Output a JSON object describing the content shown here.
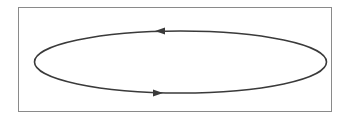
{
  "diagram": {
    "type": "closed-loop",
    "colors": {
      "frame": "#8a8a8a",
      "loop": "#3a3a3a",
      "background": "#ffffff"
    },
    "arrows": [
      {
        "position": "top",
        "direction": "left"
      },
      {
        "position": "bottom",
        "direction": "right"
      }
    ],
    "circulation": "counter-clockwise"
  }
}
